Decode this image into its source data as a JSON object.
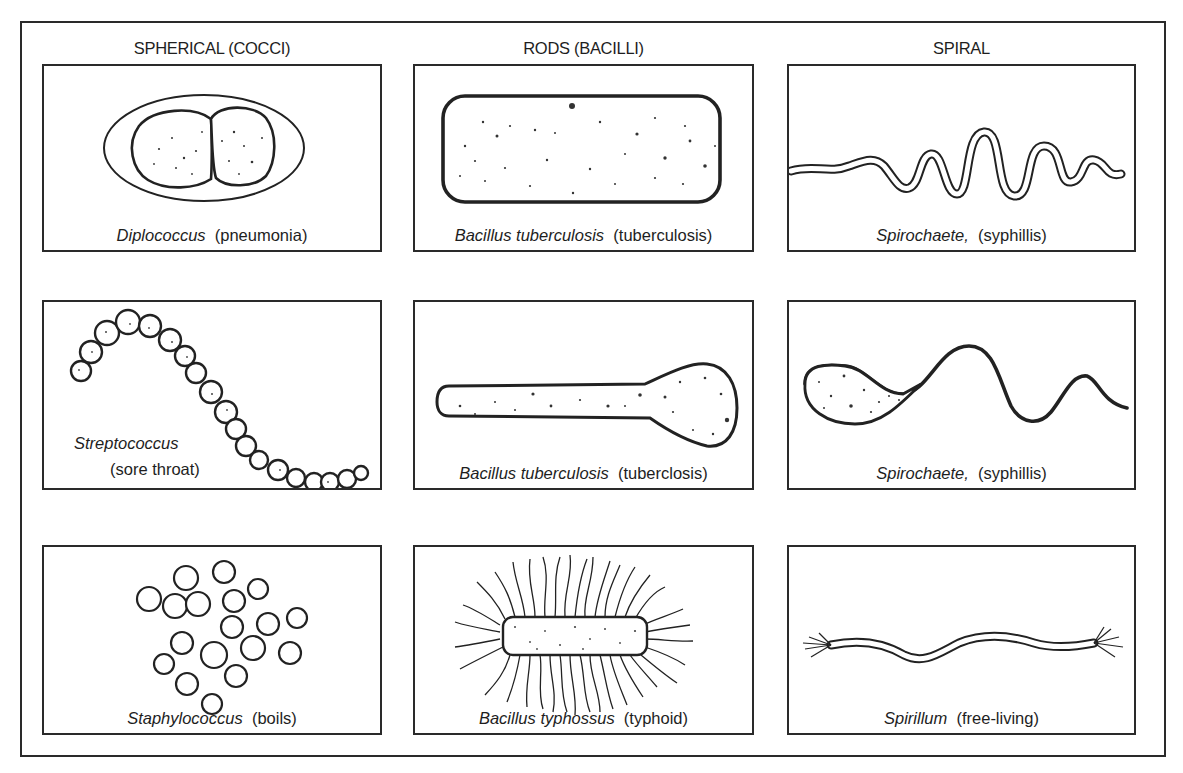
{
  "figure": {
    "columns": [
      {
        "heading": "SPHERICAL (COCCI)"
      },
      {
        "heading": "RODS (BACILLI)"
      },
      {
        "heading": "SPIRAL"
      }
    ],
    "panels": [
      {
        "row": 0,
        "col": 0,
        "illustration": "diplococcus-drawing",
        "genus": "Diplococcus",
        "disease": "(pneumonia)"
      },
      {
        "row": 0,
        "col": 1,
        "illustration": "rod-bacillus-drawing",
        "genus": "Bacillus tuberculosis",
        "disease": "(tuberculosis)"
      },
      {
        "row": 0,
        "col": 2,
        "illustration": "spirochaete-wave-drawing",
        "genus": "Spirochaete,",
        "disease": "(syphillis)"
      },
      {
        "row": 1,
        "col": 0,
        "illustration": "streptococcus-chain-drawing",
        "genus": "Streptococcus",
        "disease": "(sore throat)"
      },
      {
        "row": 1,
        "col": 1,
        "illustration": "club-shaped-bacillus-drawing",
        "genus": "Bacillus tuberculosis",
        "disease": "(tuberclosis)"
      },
      {
        "row": 1,
        "col": 2,
        "illustration": "spirochaete-tailed-drawing",
        "genus": "Spirochaete,",
        "disease": "(syphillis)"
      },
      {
        "row": 2,
        "col": 0,
        "illustration": "staphylococcus-cluster-drawing",
        "genus": "Staphylococcus",
        "disease": "(boils)"
      },
      {
        "row": 2,
        "col": 1,
        "illustration": "flagellated-bacillus-drawing",
        "genus": "Bacillus typhossus",
        "disease": "(typhoid)"
      },
      {
        "row": 2,
        "col": 2,
        "illustration": "spirillum-drawing",
        "genus": "Spirillum",
        "disease": "(free-living)"
      }
    ]
  }
}
